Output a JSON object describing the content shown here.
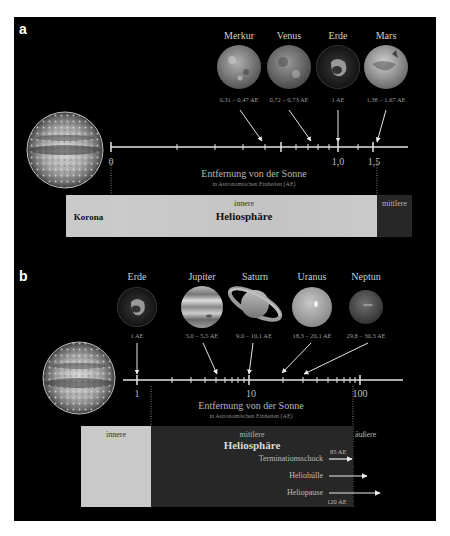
{
  "panel_a": {
    "letter": "a",
    "planets": [
      {
        "name": "Merkur",
        "range": "0,31 – 0,47 AE",
        "color": "#8a8a8a"
      },
      {
        "name": "Venus",
        "range": "0,72 – 0,73 AE",
        "color": "#7d7d7d"
      },
      {
        "name": "Erde",
        "range": "1 AE",
        "color": "#3a3a3a"
      },
      {
        "name": "Mars",
        "range": "1,38 – 1,67 AE",
        "color": "#a6a6a6"
      }
    ],
    "axis": {
      "ticks": [
        "0",
        "1,0",
        "1,5"
      ],
      "title": "Entfernung von der Sonne",
      "subtitle": "in Astronomischen Einheiten (AE)"
    },
    "regions": {
      "korona": "Korona",
      "inner_small": "innere",
      "inner_big": "Heliosphäre",
      "middle_small": "mittlere"
    }
  },
  "panel_b": {
    "letter": "b",
    "planets": [
      {
        "name": "Erde",
        "range": "1 AE",
        "color": "#3a3a3a"
      },
      {
        "name": "Jupiter",
        "range": "5,0 – 5,5 AE",
        "color": "#9a9a9a"
      },
      {
        "name": "Saturn",
        "range": "9,0 – 10,1 AE",
        "color": "#9e9e9e"
      },
      {
        "name": "Uranus",
        "range": "18,3 – 20,1 AE",
        "color": "#a8a8a8"
      },
      {
        "name": "Neptun",
        "range": "29,8 – 30,3 AE",
        "color": "#5e5e5e"
      }
    ],
    "axis": {
      "ticks": [
        "1",
        "10",
        "100"
      ],
      "title": "Entfernung von der Sonne",
      "subtitle": "in Astronomischen Einheiten (AE)"
    },
    "regions": {
      "inner_small": "innere",
      "middle_small": "mittlere",
      "middle_big": "Heliosphäre",
      "outer_small": "äußere"
    },
    "features": [
      {
        "name": "Terminationsschock",
        "distance": "85 AE"
      },
      {
        "name": "Heliohülle",
        "distance": ""
      },
      {
        "name": "Heliopause",
        "distance": "120 AE"
      }
    ]
  },
  "colors": {
    "background": "#000000",
    "region_light": "#c9c9c9",
    "region_dark": "#272727",
    "axis": "#e6e6e6"
  }
}
